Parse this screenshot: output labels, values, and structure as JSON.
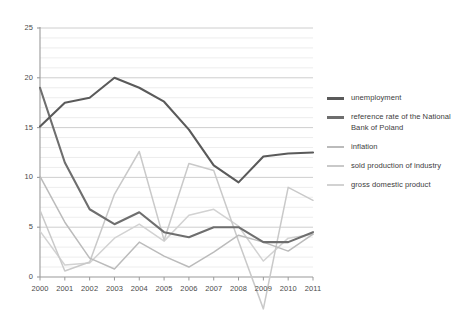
{
  "chart_data": {
    "type": "line",
    "title": "",
    "subtitle": "",
    "xlabel": "",
    "ylabel": "",
    "categories": [
      "2000",
      "2001",
      "2002",
      "2003",
      "2004",
      "2005",
      "2006",
      "2007",
      "2008",
      "2009",
      "2010",
      "2011"
    ],
    "x": [
      2000,
      2001,
      2002,
      2003,
      2004,
      2005,
      2006,
      2007,
      2008,
      2009,
      2010,
      2011
    ],
    "xlim": [
      2000,
      2011
    ],
    "ylim": [
      0,
      25
    ],
    "y_major_ticks": [
      0,
      5,
      10,
      15,
      20,
      25
    ],
    "y_minor_step": 1,
    "grid": "horizontal",
    "legend_position": "right",
    "series": [
      {
        "name": "unemployment",
        "color": "#5a5a5a",
        "width": 2.1,
        "values": [
          15.1,
          17.5,
          18.0,
          20.0,
          19.0,
          17.6,
          14.8,
          11.2,
          9.5,
          12.1,
          12.4,
          12.5
        ]
      },
      {
        "name": "reference rate of the National Bank of Poland",
        "color": "#6e6e6e",
        "width": 2.1,
        "values": [
          19.0,
          11.5,
          6.8,
          5.3,
          6.5,
          4.5,
          4.0,
          5.0,
          5.0,
          3.5,
          3.5,
          4.5
        ]
      },
      {
        "name": "inflation",
        "color": "#bbbbbb",
        "width": 1.5,
        "values": [
          10.1,
          5.5,
          1.9,
          0.8,
          3.5,
          2.1,
          1.0,
          2.5,
          4.2,
          3.5,
          2.6,
          4.3
        ]
      },
      {
        "name": "sold production of industry",
        "color": "#c9c9c9",
        "width": 1.5,
        "values": [
          6.7,
          0.6,
          1.5,
          8.3,
          12.6,
          3.7,
          11.4,
          10.7,
          3.6,
          -3.2,
          9.0,
          7.7
        ]
      },
      {
        "name": "gross domestic product",
        "color": "#d2d2d2",
        "width": 1.5,
        "values": [
          4.6,
          1.2,
          1.4,
          3.9,
          5.3,
          3.6,
          6.2,
          6.8,
          5.1,
          1.6,
          3.9,
          4.3
        ]
      }
    ]
  },
  "axes": {
    "y_ticks": [
      "0",
      "5",
      "10",
      "15",
      "20",
      "25"
    ],
    "x_ticks": [
      "2000",
      "2001",
      "2002",
      "2003",
      "2004",
      "2005",
      "2006",
      "2007",
      "2008",
      "2009",
      "2010",
      "2011"
    ]
  },
  "legend": {
    "items": [
      {
        "label": "unemployment",
        "color": "#5a5a5a"
      },
      {
        "label": "reference rate of the National Bank of Poland",
        "color": "#6e6e6e"
      },
      {
        "label": "inflation",
        "color": "#bbbbbb"
      },
      {
        "label": "sold production of industry",
        "color": "#c9c9c9"
      },
      {
        "label": "gross domestic product",
        "color": "#d2d2d2"
      }
    ]
  },
  "colors": {
    "axis": "#9a9a9a",
    "gridline_major": "#c8c8c8",
    "gridline_minor": "#e8e8e8",
    "text": "#3d3d3d",
    "background": "#ffffff"
  }
}
